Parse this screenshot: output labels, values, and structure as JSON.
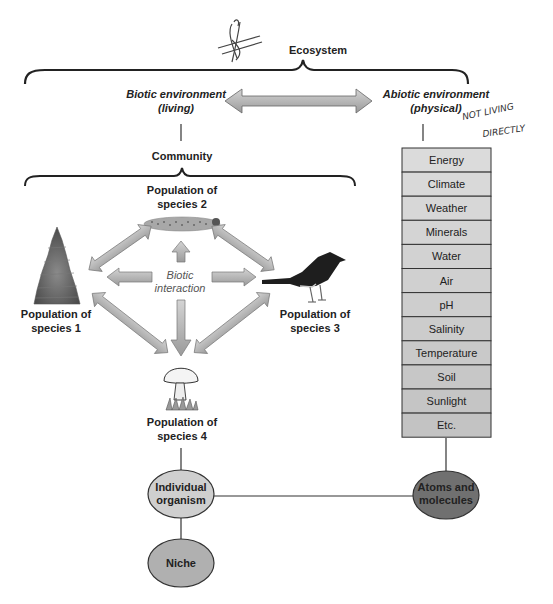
{
  "diagram": {
    "title": "Ecosystem",
    "biotic": {
      "line1": "Biotic environment",
      "line2": "(living)"
    },
    "abiotic": {
      "line1": "Abiotic environment",
      "line2": "(physical)"
    },
    "community": "Community",
    "species": [
      {
        "id": 1,
        "line1": "Population of",
        "line2": "species 1",
        "icon": "tree-icon"
      },
      {
        "id": 2,
        "line1": "Population of",
        "line2": "species 2",
        "icon": "caterpillar-icon"
      },
      {
        "id": 3,
        "line1": "Population of",
        "line2": "species 3",
        "icon": "bird-icon"
      },
      {
        "id": 4,
        "line1": "Population of",
        "line2": "species 4",
        "icon": "mushroom-icon"
      }
    ],
    "biotic_interaction": {
      "line1": "Biotic",
      "line2": "interaction"
    },
    "abiotic_factors": [
      "Energy",
      "Climate",
      "Weather",
      "Minerals",
      "Water",
      "Air",
      "pH",
      "Salinity",
      "Temperature",
      "Soil",
      "Sunlight",
      "Etc."
    ],
    "nodes": {
      "individual": {
        "line1": "Individual",
        "line2": "organism"
      },
      "niche": {
        "label": "Niche"
      },
      "atoms": {
        "line1": "Atoms and",
        "line2": "molecules"
      }
    },
    "handwritten_note": {
      "line1": "NOT LIVING",
      "line2": "DIRECTLY"
    }
  },
  "colors": {
    "table_cell_light": "#d9d9d9",
    "table_cell_dark": "#bdbdbd",
    "arrow_fill": "#b3b3b3",
    "oval_individual": "#cfcfcf",
    "oval_niche": "#b0b0b0",
    "oval_atoms": "#707070",
    "line": "#333333"
  }
}
